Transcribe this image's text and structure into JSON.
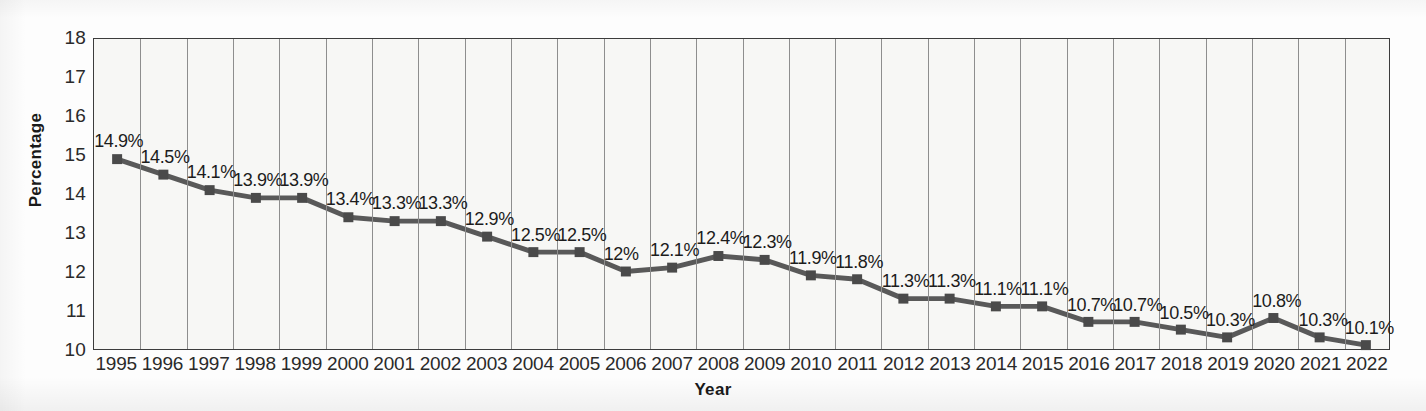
{
  "chart_data": {
    "type": "line",
    "title": "",
    "xlabel": "Year",
    "ylabel": "Percentage",
    "ylim": [
      10,
      18
    ],
    "ytick_values": [
      18,
      17,
      16,
      15,
      14,
      13,
      12,
      11,
      10
    ],
    "ytick_labels": [
      "18",
      "17",
      "16",
      "15",
      "14",
      "13",
      "12",
      "11",
      "10"
    ],
    "grid": "vertical",
    "legend": "none",
    "categories": [
      "1995",
      "1996",
      "1997",
      "1998",
      "1999",
      "2000",
      "2001",
      "2002",
      "2003",
      "2004",
      "2005",
      "2006",
      "2007",
      "2008",
      "2009",
      "2010",
      "2011",
      "2012",
      "2013",
      "2014",
      "2015",
      "2016",
      "2017",
      "2018",
      "2019",
      "2020",
      "2021",
      "2022"
    ],
    "values": [
      14.9,
      14.5,
      14.1,
      13.9,
      13.9,
      13.4,
      13.3,
      13.3,
      12.9,
      12.5,
      12.5,
      12.0,
      12.1,
      12.4,
      12.3,
      11.9,
      11.8,
      11.3,
      11.3,
      11.1,
      11.1,
      10.7,
      10.7,
      10.5,
      10.3,
      10.8,
      10.3,
      10.1
    ],
    "point_labels": [
      "14.9%",
      "14.5%",
      "14.1%",
      "13.9%",
      "13.9%",
      "13.4%",
      "13.3%",
      "13.3%",
      "12.9%",
      "12.5%",
      "12.5%",
      "12%",
      "12.1%",
      "12.4%",
      "12.3%",
      "11.9%",
      "11.8%",
      "11.3%",
      "11.3%",
      "11.1%",
      "11.1%",
      "10.7%",
      "10.7%",
      "10.5%",
      "10.3%",
      "10.8%",
      "10.3%",
      "10.1%"
    ],
    "series_name": "Percentage",
    "colors": {
      "line": "#595959",
      "marker": "#4a4a4a",
      "grid": "#8e8e8e",
      "axis": "#3c3c3c",
      "plot_background": "#f7f7f5",
      "text": "#1c1c1c"
    },
    "marker": "square"
  }
}
